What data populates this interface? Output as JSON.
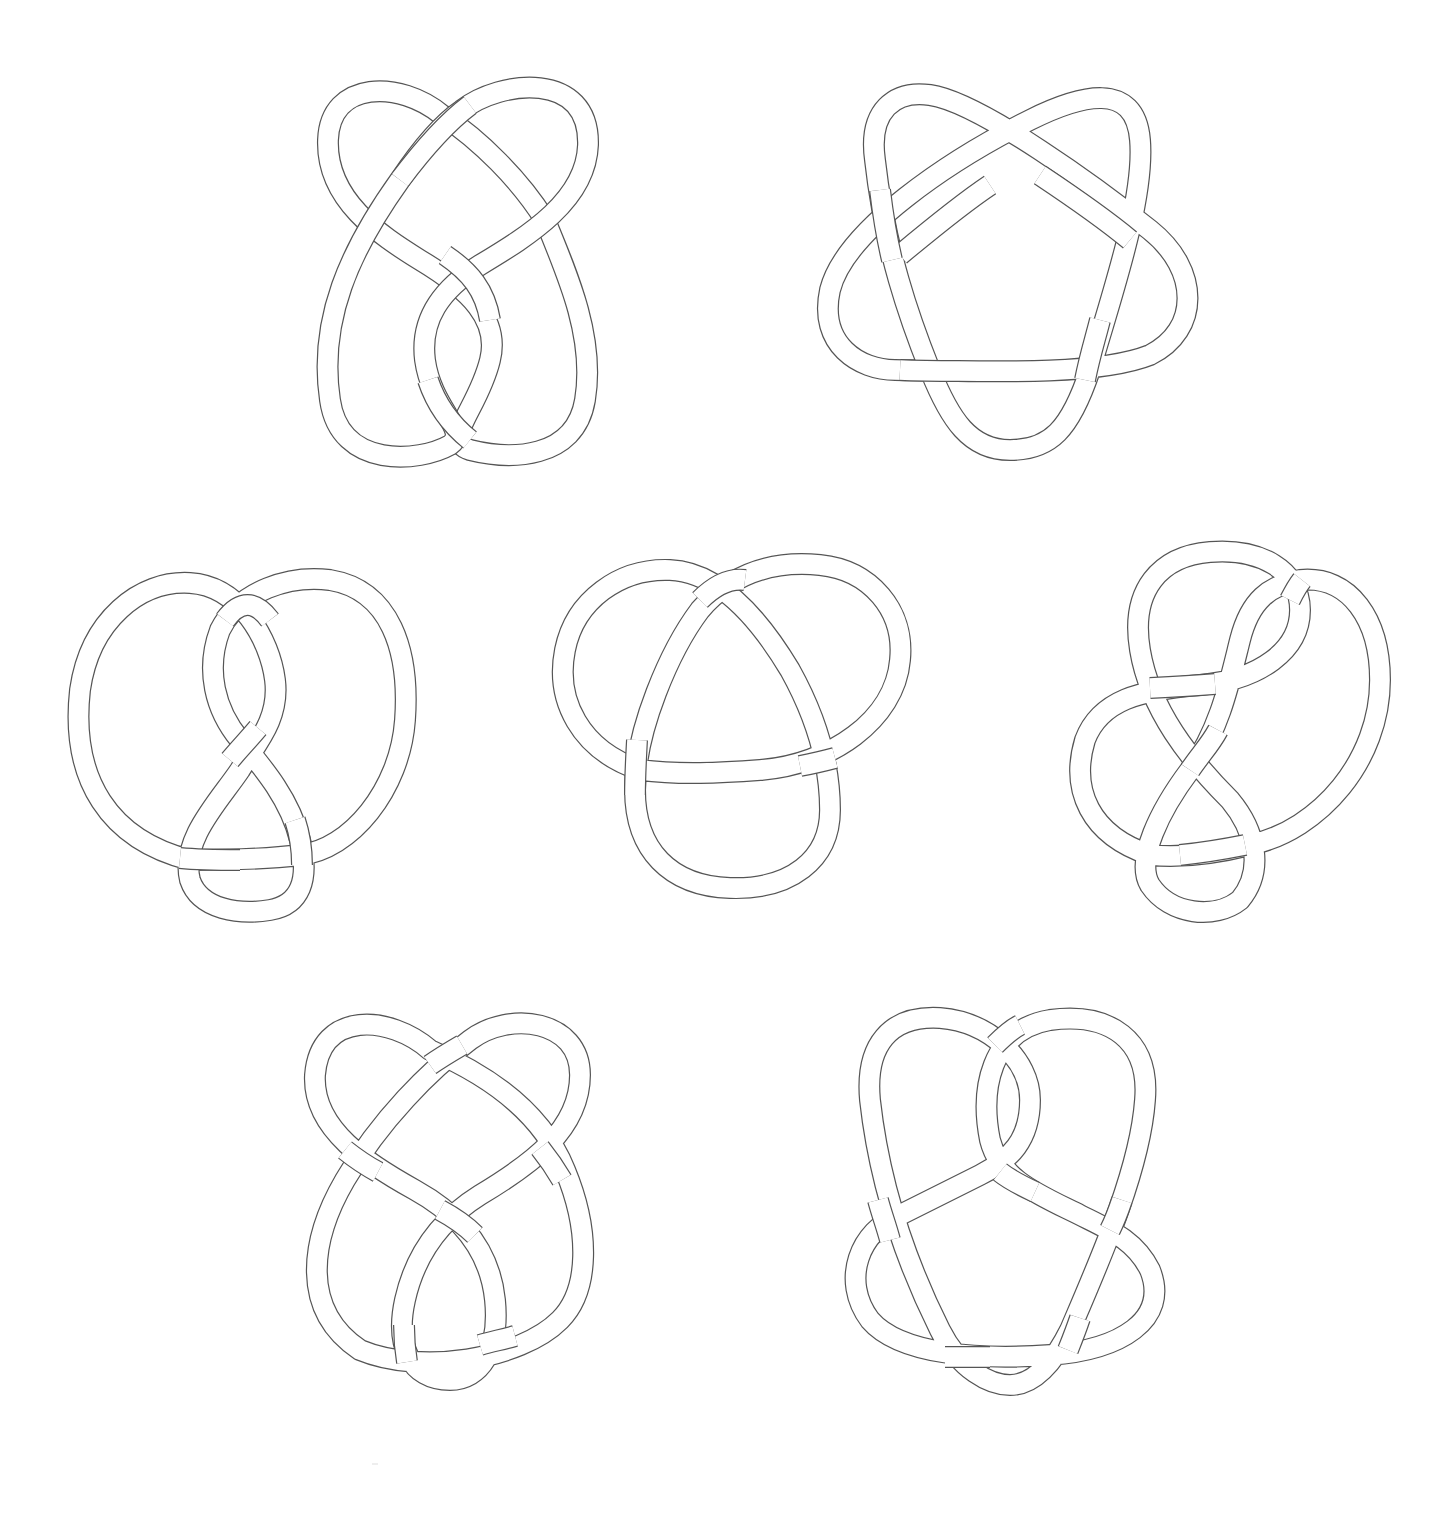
{
  "figure": {
    "background": "#ffffff",
    "stroke_color": "#555555",
    "tube_fill": "#ffffff",
    "knots": [
      {
        "id": "knot-1",
        "position": "top-left",
        "type": "figure-eight-like 6-crossing knot",
        "crossings": 6
      },
      {
        "id": "knot-2",
        "position": "top-right",
        "type": "cinquefoil (5_1)",
        "crossings": 5
      },
      {
        "id": "knot-3",
        "position": "middle-left",
        "type": "figure-eight-like twist knot",
        "crossings": 5
      },
      {
        "id": "knot-4",
        "position": "middle-center",
        "type": "trefoil (3_1)",
        "crossings": 3
      },
      {
        "id": "knot-5",
        "position": "middle-right",
        "type": "twist knot",
        "crossings": 6
      },
      {
        "id": "knot-6",
        "position": "bottom-left",
        "type": "7-crossing knot",
        "crossings": 7
      },
      {
        "id": "knot-7",
        "position": "bottom-right",
        "type": "7-crossing knot",
        "crossings": 7
      }
    ]
  }
}
